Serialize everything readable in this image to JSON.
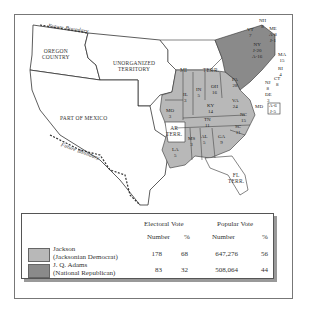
{
  "map": {
    "regions": [
      {
        "name": "Oregon Country",
        "label": "OREGON\nCOUNTRY"
      },
      {
        "name": "Unorganized Territory",
        "label": "UNORGANIZED\nTERRITORY"
      },
      {
        "name": "Part of Mexico",
        "label": "PART OF MEXICO"
      },
      {
        "name": "Michigan Territory",
        "label_a": "MI",
        "label_b": "TERR."
      },
      {
        "name": "Arkansas Territory",
        "label": "AR\nTERR."
      },
      {
        "name": "Florida Territory",
        "label": "FL\nTERR."
      }
    ],
    "boundary_label": "Future Boundary",
    "states": [
      {
        "abbr": "ME",
        "votes": "A-8\nJ-1",
        "winner": "split"
      },
      {
        "abbr": "NH",
        "votes": "8",
        "winner": "adams"
      },
      {
        "abbr": "VT",
        "votes": "7",
        "winner": "adams"
      },
      {
        "abbr": "MA",
        "votes": "15",
        "winner": "adams"
      },
      {
        "abbr": "RI",
        "votes": "4",
        "winner": "adams"
      },
      {
        "abbr": "CT",
        "votes": "8",
        "winner": "adams"
      },
      {
        "abbr": "NY",
        "votes": "J-20\nA-16",
        "winner": "split"
      },
      {
        "abbr": "NJ",
        "votes": "8",
        "winner": "adams"
      },
      {
        "abbr": "DE",
        "votes": "3",
        "winner": "adams"
      },
      {
        "abbr": "MD",
        "votes": "A-6\nJ-5",
        "winner": "split"
      },
      {
        "abbr": "PA",
        "votes": "28",
        "winner": "jackson"
      },
      {
        "abbr": "OH",
        "votes": "16",
        "winner": "jackson"
      },
      {
        "abbr": "IN",
        "votes": "5",
        "winner": "jackson"
      },
      {
        "abbr": "IL",
        "votes": "3",
        "winner": "jackson"
      },
      {
        "abbr": "MO",
        "votes": "3",
        "winner": "jackson"
      },
      {
        "abbr": "KY",
        "votes": "14",
        "winner": "jackson"
      },
      {
        "abbr": "VA",
        "votes": "24",
        "winner": "jackson"
      },
      {
        "abbr": "NC",
        "votes": "15",
        "winner": "jackson"
      },
      {
        "abbr": "TN",
        "votes": "11",
        "winner": "jackson"
      },
      {
        "abbr": "SC",
        "votes": "11",
        "winner": "jackson"
      },
      {
        "abbr": "GA",
        "votes": "9",
        "winner": "jackson"
      },
      {
        "abbr": "AL",
        "votes": "5",
        "winner": "jackson"
      },
      {
        "abbr": "MS",
        "votes": "3",
        "winner": "jackson"
      },
      {
        "abbr": "LA",
        "votes": "5",
        "winner": "jackson"
      }
    ],
    "colors": {
      "jackson": "#b8b8b8",
      "adams": "#8a8a8a",
      "territory": "#ffffff",
      "border": "#333333"
    }
  },
  "legend": {
    "headers": {
      "electoral": "Electoral Vote",
      "popular": "Popular Vote",
      "number": "Number",
      "percent": "%"
    },
    "rows": [
      {
        "candidate": "Jackson",
        "party": "(Jacksonian Democrat)",
        "ev_number": "178",
        "ev_percent": "68",
        "pv_number": "647,276",
        "pv_percent": "56",
        "color": "#b8b8b8"
      },
      {
        "candidate": "J. Q. Adams",
        "party": "(National Republican)",
        "ev_number": "83",
        "ev_percent": "32",
        "pv_number": "508,064",
        "pv_percent": "44",
        "color": "#8a8a8a"
      }
    ]
  }
}
